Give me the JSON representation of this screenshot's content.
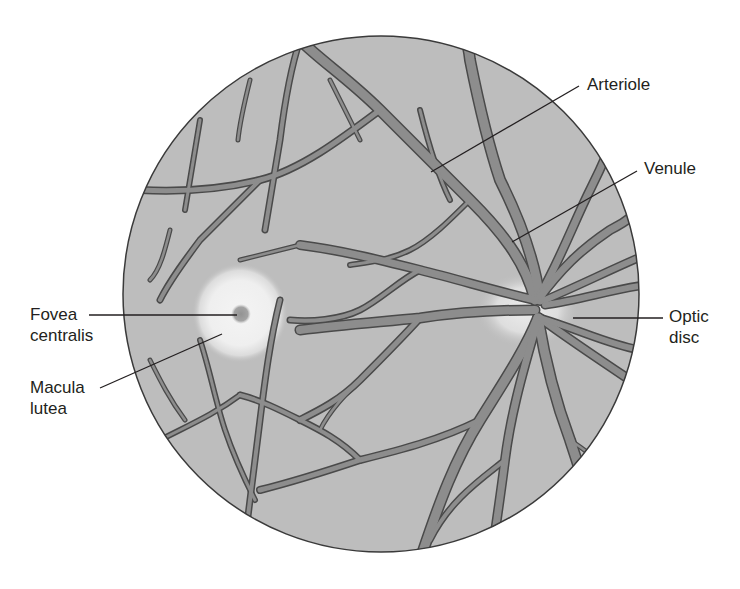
{
  "diagram": {
    "colors": {
      "background": "#ffffff",
      "retina_fill": "#bdbdbd",
      "retina_border": "#3a3a3a",
      "vessel_fill": "#8d8d8d",
      "vessel_outline": "#4a4a4a",
      "macula_glow": "#f2f2f2",
      "fovea_spot": "#9a9a9a",
      "label_text": "#231f20"
    },
    "labels": {
      "arteriole": "Arteriole",
      "venule": "Venule",
      "optic_disc_line1": "Optic",
      "optic_disc_line2": "disc",
      "fovea_line1": "Fovea",
      "fovea_line2": "centralis",
      "macula_line1": "Macula",
      "macula_line2": "lutea"
    }
  }
}
